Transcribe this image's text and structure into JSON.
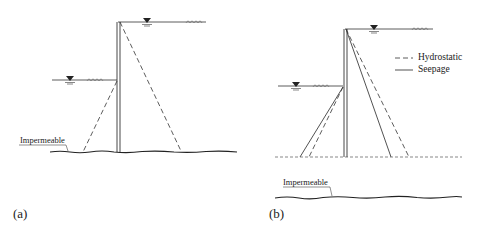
{
  "figure": {
    "panels": [
      {
        "id": "a",
        "caption": "(a)",
        "impermeable_label": "Impermeable",
        "lines": [
          "hydrostatic"
        ]
      },
      {
        "id": "b",
        "caption": "(b)",
        "impermeable_label": "Impermeable",
        "lines": [
          "hydrostatic",
          "seepage"
        ]
      }
    ],
    "legend": {
      "hydrostatic_label": "Hydrostatic",
      "seepage_label": "Seepage"
    },
    "colors": {
      "stroke": "#333333",
      "background": "#ffffff"
    },
    "icons": [
      "water-level-triangle-icon",
      "soil-hatch-icon"
    ]
  }
}
